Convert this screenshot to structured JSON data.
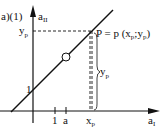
{
  "figure": {
    "panel_label": "a)(1)",
    "y_axis": {
      "label": "a",
      "label_sub": "II"
    },
    "x_axis": {
      "label": "a",
      "label_sub": "I"
    },
    "y_ticks": [
      {
        "label": "1"
      }
    ],
    "x_ticks": [
      {
        "label": "1"
      },
      {
        "label": "a"
      }
    ],
    "point": {
      "name": "P",
      "equation_prefix": "P = p (x",
      "equation_sub1": "p",
      "equation_mid": ";y",
      "equation_sub2": "p",
      "equation_suffix": ")"
    },
    "y_projection_label": {
      "main": "y",
      "sub": "p"
    },
    "x_projection_label": {
      "main": "x",
      "sub": "p"
    },
    "brace_label": {
      "main": "y",
      "sub": "p"
    },
    "colors": {
      "ink": "#111111",
      "background": "#ffffff"
    }
  }
}
